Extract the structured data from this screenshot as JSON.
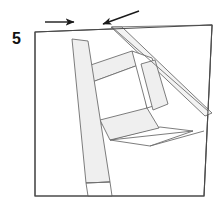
{
  "diagram": {
    "kind": "origami-fold-step",
    "step_label": "5",
    "caption": "",
    "canvas": {
      "width": 224,
      "height": 203
    },
    "colors": {
      "paper_fill": "#ffffff",
      "flap_fill": "#f2f2f2",
      "shaded_fill": "#efefef",
      "edge_stroke": "#4a4a4a",
      "crease_stroke": "#6e6e6e",
      "arrow_stroke": "#1a1a1a",
      "background": "#ffffff",
      "step_text": "#111111"
    },
    "stroke_widths": {
      "outer_edge": 1.1,
      "crease": 0.9,
      "arrow": 1.4
    },
    "sheet": {
      "name": "base-square",
      "corners": {
        "top_left": [
          35,
          32
        ],
        "top_right": [
          212,
          25
        ],
        "bottom_right": [
          204,
          196
        ],
        "bottom_left": [
          35,
          196
        ]
      },
      "points": "35,32 212,25 204,196 35,196"
    },
    "shapes": [
      {
        "name": "top-right-flap-triangle",
        "fill": "#ffffff",
        "points": "112,27 212,25 208,111"
      },
      {
        "name": "flap-long-band",
        "fill": "#f3f3f3",
        "points": "111,27 122,27 212,113 205,116"
      },
      {
        "name": "upper-left-strip",
        "fill": "#efefef",
        "points": "76,70 132,51 141,64 84,85"
      },
      {
        "name": "center-left-panel",
        "fill": "#ffffff",
        "points": "84,85 141,64 147,110 92,127"
      },
      {
        "name": "right-diagonal-band",
        "fill": "#efefef",
        "points": "141,64 155,60 168,104 153,110"
      },
      {
        "name": "right-upper-panel",
        "fill": "#ffffff",
        "points": "132,51 152,58 166,102 147,108"
      },
      {
        "name": "lower-center-band",
        "fill": "#efefef",
        "points": "100,120 147,108 159,128 110,140"
      },
      {
        "name": "lower-right-panel",
        "fill": "#ffffff",
        "points": "110,140 160,127 193,131 150,146"
      },
      {
        "name": "long-left-strip",
        "fill": "#efefef",
        "points": "72,39 88,41 110,182 86,183"
      },
      {
        "name": "left-strip-foot",
        "fill": "#ffffff",
        "points": "86,183 110,182 112,196 88,196"
      }
    ],
    "creases": [
      {
        "name": "crease-left-strip-inner",
        "points": "72,39 92,184"
      },
      {
        "name": "crease-left-strip-outer",
        "points": "88,41 110,182"
      },
      {
        "name": "crease-flap-left-edge",
        "points": "111,27 205,116"
      },
      {
        "name": "crease-flap-right-edge",
        "points": "122,27 212,113"
      },
      {
        "name": "crease-flap-hypotenuse",
        "points": "112,27 208,111"
      },
      {
        "name": "crease-upper-strip-top",
        "points": "76,70 132,51"
      },
      {
        "name": "crease-upper-strip-bottom",
        "points": "84,85 141,64"
      },
      {
        "name": "crease-center-panel-bottom",
        "points": "92,127 147,110"
      },
      {
        "name": "crease-right-band-left",
        "points": "141,64 153,110"
      },
      {
        "name": "crease-right-band-right",
        "points": "155,60 168,104"
      },
      {
        "name": "crease-lower-band-top",
        "points": "100,120 147,108"
      },
      {
        "name": "crease-lower-band-bottom",
        "points": "110,140 159,128"
      },
      {
        "name": "crease-lower-right-edge",
        "points": "110,140 193,131"
      },
      {
        "name": "crease-bottom-right-fold",
        "points": "150,146 204,131"
      },
      {
        "name": "crease-foot-line",
        "points": "86,183 110,182"
      }
    ],
    "arrows": [
      {
        "name": "arrow-right-top-left",
        "direction": "right",
        "from": [
          45,
          22
        ],
        "to": [
          77,
          22
        ],
        "head_at": [
          77,
          22
        ]
      },
      {
        "name": "arrow-left-top-right",
        "direction": "up-left",
        "from": [
          139,
          11
        ],
        "to": [
          100,
          25
        ],
        "head_at": [
          100,
          25
        ]
      }
    ]
  }
}
